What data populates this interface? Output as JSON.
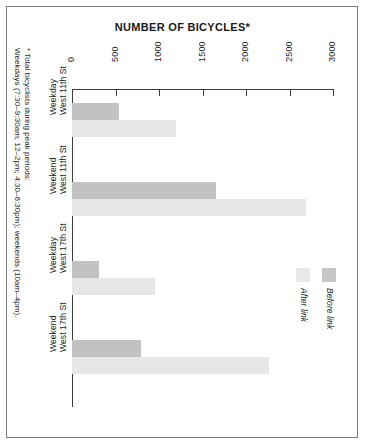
{
  "chart_data": {
    "type": "bar",
    "orientation": "horizontal",
    "title": "NUMBER OF BICYCLES*",
    "xlabel": "",
    "ylabel": "",
    "xlim": [
      0,
      3000
    ],
    "grid": false,
    "legend_position": "right",
    "tick_labels": [
      "0",
      "500",
      "1000",
      "1500",
      "2000",
      "2500",
      "3000"
    ],
    "tick_values": [
      0,
      500,
      1000,
      1500,
      2000,
      2500,
      3000
    ],
    "categories": [
      {
        "location": "West 11th St",
        "period": "Weekday"
      },
      {
        "location": "West 11th St",
        "period": "Weekend"
      },
      {
        "location": "West 17th St",
        "period": "Weekday"
      },
      {
        "location": "West 17th St",
        "period": "Weekend"
      }
    ],
    "series": [
      {
        "name": "Before link",
        "color": "#c2c2c2",
        "values": [
          540,
          1650,
          310,
          790
        ]
      },
      {
        "name": "After link",
        "color": "#e7e7e7",
        "values": [
          1190,
          2690,
          950,
          2270
        ]
      }
    ],
    "footnote": {
      "line1": "* Total bicyclists during peak periods:",
      "line2": "Weekdays (7:30–9:30am; 12–2pm; 4:30–6:30pm); weekends (10am–4pm)."
    }
  },
  "legend": {
    "entries": [
      {
        "label": "After link",
        "color": "#e9e9e9"
      },
      {
        "label": "Before link",
        "color": "#c6c6c6"
      }
    ]
  },
  "colors": {
    "before_link": "#c2c2c2",
    "after_link": "#e7e7e7",
    "axis": "#3c3c3c",
    "border": "#7d7d7d",
    "text": "#1a1a1a",
    "background": "#ffffff"
  }
}
